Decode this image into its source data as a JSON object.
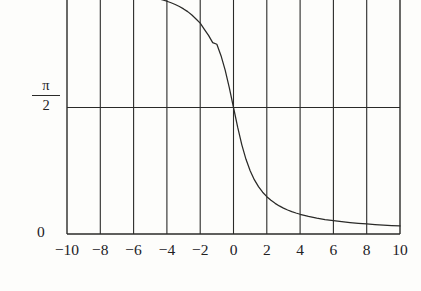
{
  "figure": {
    "background_color": "#fdfdfb",
    "line_color": "#2a2a28",
    "text_color": "#22211f"
  },
  "axes": {
    "y_labels": {
      "zero": "0",
      "pi_half_numerator": "π",
      "pi_half_denominator": "2"
    }
  },
  "chart_data": {
    "type": "line",
    "title": "",
    "subtitle": "",
    "xlabel": "",
    "ylabel": "",
    "function": "arccot(x)",
    "xlim": [
      -10,
      10
    ],
    "ylim": [
      0,
      3.141592653589793
    ],
    "xticks": [
      -10,
      -8,
      -6,
      -4,
      -2,
      0,
      2,
      4,
      6,
      8,
      10
    ],
    "xticklabels": [
      "−10",
      "−8",
      "−6",
      "−4",
      "−2",
      "0",
      "2",
      "4",
      "6",
      "8",
      "10"
    ],
    "yticks": [
      0,
      1.5707963267948966
    ],
    "yticklabels": [
      "0",
      "π/2"
    ],
    "grid": true,
    "grid_axis": "x",
    "legend": null,
    "legend_position": "none",
    "top_cropped": true,
    "series": [
      {
        "name": "arccot(x)",
        "x": [
          -10,
          -9.5,
          -9,
          -8.5,
          -8,
          -7.5,
          -7,
          -6.5,
          -6,
          -5.5,
          -5,
          -4.75,
          -4.5,
          -4.25,
          -4,
          -3.75,
          -3.5,
          -3.25,
          -3,
          -2.75,
          -2.5,
          -2.25,
          -2,
          -1.75,
          -1.5,
          -1.25,
          -1,
          -0.75,
          -0.5,
          -0.25,
          0,
          0.25,
          0.5,
          0.75,
          1,
          1.25,
          1.5,
          1.75,
          2,
          2.25,
          2.5,
          2.75,
          3,
          3.25,
          3.5,
          3.75,
          4,
          4.5,
          5,
          5.5,
          6,
          6.5,
          7,
          7.5,
          8,
          8.5,
          9,
          9.5,
          10
        ],
        "y": [
          3.0419,
          3.0367,
          3.0309,
          3.0245,
          3.0172,
          3.0091,
          2.9997,
          2.9891,
          2.9766,
          2.9623,
          2.9442,
          2.9339,
          2.9208,
          2.9064,
          2.8906,
          2.871,
          2.8503,
          2.825,
          2.7951,
          2.7611,
          2.7189,
          2.6704,
          2.618,
          2.5408,
          2.4668,
          2.3766,
          2.3562,
          2.2143,
          2.0344,
          1.8158,
          1.5708,
          1.3258,
          1.1071,
          0.9273,
          0.7854,
          0.6747,
          0.588,
          0.5191,
          0.4636,
          0.4182,
          0.3805,
          0.3487,
          0.3217,
          0.2984,
          0.2783,
          0.2606,
          0.245,
          0.2187,
          0.1974,
          0.1799,
          0.1651,
          0.1526,
          0.1419,
          0.1326,
          0.1244,
          0.1171,
          0.1107,
          0.1049,
          0.0997
        ]
      }
    ]
  }
}
